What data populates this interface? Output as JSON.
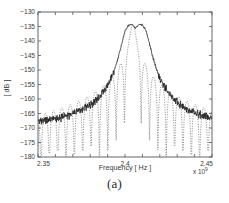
{
  "figure": {
    "caption": "(a)",
    "background_color": "#ffffff"
  },
  "axes": {
    "x_label": "Frequency [ Hz ]",
    "y_label": "[ dB ]",
    "x_exponent_label": "x 10",
    "x_exponent_value": "9",
    "x_ticks": [
      "2.35",
      "2.4",
      "2.45"
    ],
    "y_ticks": [
      "-130",
      "-135",
      "-140",
      "-145",
      "-150",
      "-155",
      "-160",
      "-165",
      "-170",
      "-175",
      "-180"
    ],
    "axis_color": "#555555",
    "tick_label_color": "#3a3a3a"
  },
  "chart_data": {
    "type": "line",
    "title": "",
    "xlabel": "Frequency [ Hz ]",
    "ylabel": "[ dB ]",
    "xlim": [
      2350000000.0,
      2450000000.0
    ],
    "ylim": [
      -180,
      -130
    ],
    "xtick_values": [
      2350000000.0,
      2400000000.0,
      2450000000.0
    ],
    "ytick_values": [
      -130,
      -135,
      -140,
      -145,
      -150,
      -155,
      -160,
      -165,
      -170,
      -175,
      -180
    ],
    "x_scale_exponent": 9,
    "grid": false,
    "legend": null,
    "series": [
      {
        "name": "measured-spectrum-envelope",
        "style": "solid-noisy",
        "color": "#1a1a1a",
        "description": "Noisy measured power spectral density with jagged ripple riding on a smooth mainlobe-plus-skirt envelope centred at 2.4 GHz",
        "x": [
          2350000000.0,
          2352000000.0,
          2354000000.0,
          2356000000.0,
          2358000000.0,
          2360000000.0,
          2362000000.0,
          2364000000.0,
          2366000000.0,
          2368000000.0,
          2370000000.0,
          2372000000.0,
          2374000000.0,
          2376000000.0,
          2378000000.0,
          2380000000.0,
          2382000000.0,
          2384000000.0,
          2386000000.0,
          2388000000.0,
          2390000000.0,
          2392000000.0,
          2394000000.0,
          2396000000.0,
          2398000000.0,
          2400000000.0,
          2402000000.0,
          2404000000.0,
          2406000000.0,
          2408000000.0,
          2410000000.0,
          2412000000.0,
          2414000000.0,
          2416000000.0,
          2418000000.0,
          2420000000.0,
          2422000000.0,
          2424000000.0,
          2426000000.0,
          2428000000.0,
          2430000000.0,
          2432000000.0,
          2434000000.0,
          2436000000.0,
          2438000000.0,
          2440000000.0,
          2442000000.0,
          2444000000.0,
          2446000000.0,
          2448000000.0,
          2450000000.0
        ],
        "y": [
          -167.6,
          -167.5,
          -167.4,
          -167.2,
          -167.0,
          -166.8,
          -166.5,
          -166.2,
          -165.9,
          -165.5,
          -165.1,
          -164.6,
          -164.1,
          -163.5,
          -162.8,
          -162.0,
          -161.1,
          -160.0,
          -158.7,
          -157.1,
          -155.2,
          -152.8,
          -149.8,
          -146.0,
          -141.2,
          -136.6,
          -134.6,
          -134.2,
          -135.6,
          -134.3,
          -134.4,
          -136.3,
          -140.8,
          -145.6,
          -149.6,
          -152.6,
          -155.0,
          -157.0,
          -158.6,
          -159.9,
          -161.0,
          -162.0,
          -162.8,
          -163.5,
          -164.1,
          -164.6,
          -165.1,
          -165.5,
          -165.9,
          -166.2,
          -166.5
        ]
      },
      {
        "name": "theoretical-sinc-spectrum",
        "style": "dotted",
        "color": "#666666",
        "description": "Dotted ideal spectrum showing deep sidelobe nulls reaching below -180 dB between lobes",
        "x": [
          2350000000.0,
          2353000000.0,
          2356000000.0,
          2359000000.0,
          2362000000.0,
          2365000000.0,
          2368000000.0,
          2371000000.0,
          2374000000.0,
          2377000000.0,
          2380000000.0,
          2383000000.0,
          2386000000.0,
          2389000000.0,
          2392000000.0,
          2395000000.0,
          2398000000.0,
          2400000000.0,
          2402000000.0,
          2405000000.0,
          2408000000.0,
          2411000000.0,
          2414000000.0,
          2417000000.0,
          2420000000.0,
          2423000000.0,
          2426000000.0,
          2429000000.0,
          2432000000.0,
          2435000000.0,
          2438000000.0,
          2441000000.0,
          2444000000.0,
          2447000000.0,
          2450000000.0
        ],
        "y": [
          -172.0,
          -180.0,
          -171.0,
          -169.5,
          -180.0,
          -170.5,
          -169.0,
          -180.0,
          -169.5,
          -168.0,
          -180.0,
          -167.5,
          -165.0,
          -180.0,
          -161.0,
          -152.0,
          -141.0,
          -134.5,
          -140.0,
          -151.0,
          -160.5,
          -180.0,
          -164.0,
          -166.5,
          -180.0,
          -167.5,
          -169.0,
          -180.0,
          -169.5,
          -170.5,
          -180.0,
          -171.0,
          -172.0,
          -180.0,
          -172.5
        ]
      }
    ]
  }
}
